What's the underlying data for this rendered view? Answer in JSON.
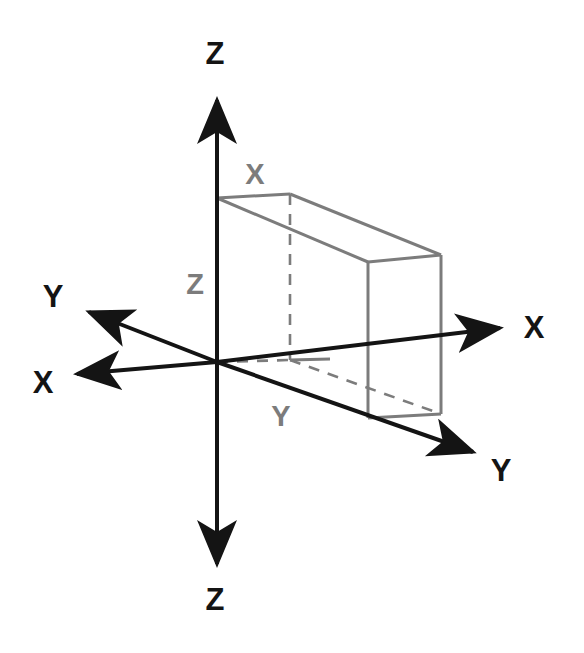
{
  "diagram": {
    "background_color": "#ffffff",
    "axis_color": "#141414",
    "box_color": "#7c7c7c",
    "axis_labels": {
      "z_up": "Z",
      "z_down": "Z",
      "x_right": "X",
      "x_left": "X",
      "y_left": "Y",
      "y_right": "Y"
    },
    "box_labels": {
      "x": "X",
      "y": "Y",
      "z": "Z"
    },
    "origin": {
      "x": 217,
      "y": 362
    },
    "axes": [
      {
        "name": "z-positive",
        "label": "Z",
        "direction": "up",
        "tip_x": 217,
        "tip_y": 92,
        "label_x": 215,
        "label_y": 64
      },
      {
        "name": "z-negative",
        "label": "Z",
        "direction": "down",
        "tip_x": 217,
        "tip_y": 572,
        "label_x": 215,
        "label_y": 610
      },
      {
        "name": "x-positive",
        "label": "X",
        "direction": "right",
        "tip_x": 508,
        "tip_y": 327,
        "label_x": 534,
        "label_y": 337
      },
      {
        "name": "x-negative",
        "label": "X",
        "direction": "left",
        "tip_x": 68,
        "tip_y": 375,
        "label_x": 42,
        "label_y": 392
      },
      {
        "name": "y-positive",
        "label": "Y",
        "direction": "lower-right",
        "tip_x": 481,
        "tip_y": 458,
        "label_x": 501,
        "label_y": 480
      },
      {
        "name": "y-negative",
        "label": "Y",
        "direction": "upper-left",
        "tip_x": 80,
        "tip_y": 308,
        "label_x": 52,
        "label_y": 307
      }
    ],
    "box": {
      "name": "rectangular-box",
      "near_top_left": {
        "x": 217,
        "y": 198
      },
      "near_bottom_left": {
        "x": 217,
        "y": 362
      },
      "far_top_left": {
        "x": 290,
        "y": 194
      },
      "far_bottom_left": {
        "x": 290,
        "y": 360
      },
      "near_top_right": {
        "x": 368,
        "y": 262
      },
      "near_bottom_right": {
        "x": 368,
        "y": 418
      },
      "far_top_right": {
        "x": 441,
        "y": 255
      },
      "far_bottom_right": {
        "x": 441,
        "y": 414
      },
      "hidden_edges": [
        "far_top_left-far_bottom_left",
        "origin-far_bottom_left",
        "far_bottom_left-far_bottom_right"
      ],
      "box_label_positions": {
        "x": {
          "x": 254,
          "y": 184
        },
        "y": {
          "x": 280,
          "y": 425
        },
        "z": {
          "x": 195,
          "y": 295
        }
      }
    }
  }
}
